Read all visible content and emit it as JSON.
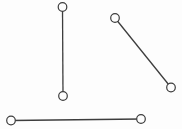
{
  "canvas": {
    "width": 182,
    "height": 129,
    "background": "#fdfdfd"
  },
  "diagram": {
    "type": "line-segments",
    "style": {
      "line_color": "#3d3d3d",
      "line_width": 1.3,
      "node_radius": 4.3,
      "node_fill": "#fdfdfd",
      "node_stroke": "#3d3d3d",
      "node_stroke_width": 1.2
    },
    "segments": [
      {
        "name": "vertical-segment",
        "x1": 62.5,
        "y1": 7,
        "x2": 63,
        "y2": 96
      },
      {
        "name": "diagonal-segment",
        "x1": 115,
        "y1": 18,
        "x2": 171,
        "y2": 87.5
      },
      {
        "name": "horizontal-segment",
        "x1": 11,
        "y1": 120.5,
        "x2": 141,
        "y2": 119
      }
    ]
  }
}
